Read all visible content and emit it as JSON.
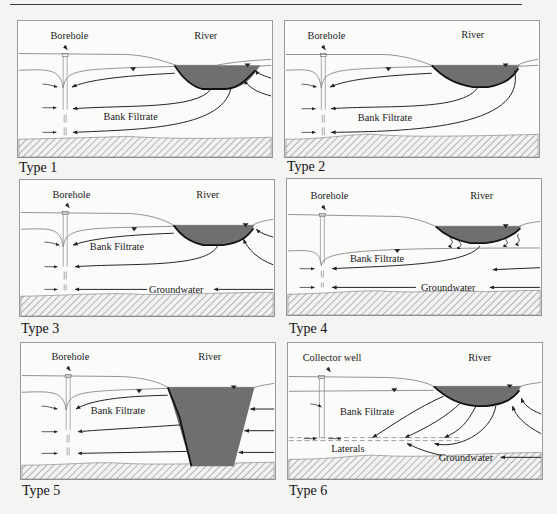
{
  "figure": {
    "colors": {
      "river_fill": "#6f6f6f",
      "river_bed": "#111111",
      "line": "#555555",
      "arrow": "#222222",
      "bedrock_hatch": "#8a8a8a",
      "panel_bg": "#fbfbfa",
      "page_bg": "#f4f4f2"
    },
    "panels": [
      {
        "caption": "Type 1",
        "well_label": "Borehole",
        "river_label": "River",
        "flow_labels": [
          "Bank Filtrate"
        ],
        "features": [
          "borehole",
          "shallow river",
          "bank filtrate from both sides of river",
          "water table above river bed"
        ]
      },
      {
        "caption": "Type 2",
        "well_label": "Borehole",
        "river_label": "River",
        "flow_labels": [
          "Bank Filtrate"
        ],
        "features": [
          "borehole",
          "shallow river",
          "bank filtrate from near bank and under river"
        ]
      },
      {
        "caption": "Type 3",
        "well_label": "Borehole",
        "river_label": "River",
        "flow_labels": [
          "Bank Filtrate",
          "Groundwater"
        ],
        "features": [
          "borehole",
          "shallow river",
          "bank filtrate",
          "regional groundwater from far side"
        ]
      },
      {
        "caption": "Type 4",
        "well_label": "Borehole",
        "river_label": "River",
        "flow_labels": [
          "Bank Filtrate",
          "Groundwater"
        ],
        "features": [
          "borehole",
          "river disconnected from water table (seepage)",
          "groundwater inflow"
        ]
      },
      {
        "caption": "Type 5",
        "well_label": "Borehole",
        "river_label": "River",
        "flow_labels": [
          "Bank Filtrate"
        ],
        "features": [
          "borehole",
          "deep river penetrating full aquifer",
          "bank filtrate only"
        ]
      },
      {
        "caption": "Type 6",
        "well_label": "Collector well",
        "river_label": "River",
        "flow_labels": [
          "Bank Filtrate",
          "Laterals",
          "Groundwater"
        ],
        "features": [
          "collector well",
          "horizontal laterals",
          "bank filtrate",
          "groundwater"
        ]
      }
    ]
  }
}
